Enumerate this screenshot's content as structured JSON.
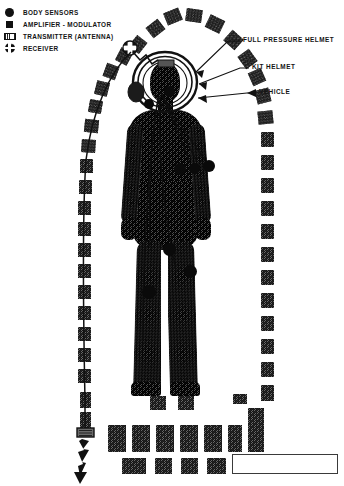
{
  "figure": {
    "legend": {
      "items": [
        {
          "icon": "filled-circle-icon",
          "label": "BODY SENSORS"
        },
        {
          "icon": "filled-square-icon",
          "label": "AMPLIFIER - MODULATOR"
        },
        {
          "icon": "hatched-rectangle-icon",
          "label": "TRANSMITTER (ANTENNA)"
        },
        {
          "icon": "crossed-circle-icon",
          "label": "RECEIVER"
        }
      ]
    },
    "callouts": [
      {
        "name": "full-pressure-helmet",
        "label": "FULL PRESSURE HELMET",
        "x": 243,
        "y": 40
      },
      {
        "name": "kit-helmet",
        "label": "KIT HELMET",
        "x": 252,
        "y": 67
      },
      {
        "name": "vehicle",
        "label": "VEHICLE",
        "x": 258,
        "y": 92
      }
    ],
    "bottom_caption": "",
    "colors": {
      "ink": "#141414",
      "texture_dark": "#111111",
      "texture_light": "#f2f2f2",
      "sensor": "#0a0a0a",
      "background": "#ffffff",
      "box_border": "#3a3a3a"
    },
    "counts": {
      "body_sensors": 8,
      "arc_blocks_top": 5,
      "arc_blocks_left": 14,
      "arc_blocks_right": 11,
      "bottom_blocks": 17
    },
    "elements": {
      "transmitter_box_label": "transmitter-antenna-box",
      "lightning_label": "radio-emission-arrow",
      "receiver_label": "receiver-node",
      "helmet_label": "helmet-assembly",
      "caption_box_text": ""
    }
  }
}
